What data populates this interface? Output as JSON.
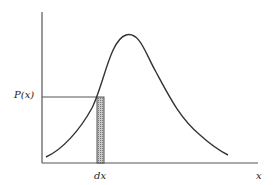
{
  "diagram": {
    "title": "",
    "labels": {
      "y_axis": "P(x)",
      "x_axis": "x",
      "strip": "dx"
    },
    "colors": {
      "background": "#ffffff",
      "curve": "#333333",
      "axes": "#555555",
      "strip_fill": "#9a9a9a",
      "text": "#222222"
    },
    "elements": [
      {
        "type": "axis",
        "name": "y-axis"
      },
      {
        "type": "axis",
        "name": "x-axis"
      },
      {
        "type": "curve",
        "name": "probability-density-curve",
        "description": "right-skewed unimodal distribution"
      },
      {
        "type": "line",
        "name": "p-of-x-level-line"
      },
      {
        "type": "shaded-strip",
        "name": "dx-strip"
      }
    ]
  }
}
